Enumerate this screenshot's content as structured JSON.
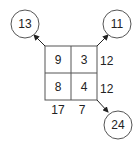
{
  "grid": {
    "cells": [
      [
        "9",
        "3"
      ],
      [
        "8",
        "4"
      ]
    ],
    "row_sums": [
      "12",
      "12"
    ],
    "col_sums": [
      "17",
      "7"
    ]
  },
  "circles": {
    "top_left": "13",
    "top_right": "11",
    "bottom_right": "24"
  },
  "colors": {
    "stroke": "#555555",
    "text": "#222222"
  }
}
